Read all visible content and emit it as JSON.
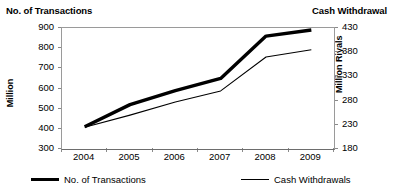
{
  "header": {
    "left_title": "No. of Transactions",
    "right_title": "Cash Withdrawal"
  },
  "axes": {
    "left_title": "Million",
    "right_title": "Million Riyals",
    "left_ticks": [
      "900",
      "800",
      "700",
      "600",
      "500",
      "400",
      "300"
    ],
    "right_ticks": [
      "430",
      "380",
      "330",
      "280",
      "230",
      "180"
    ],
    "x_ticks": [
      "2004",
      "2005",
      "2006",
      "2007",
      "2008",
      "2009"
    ]
  },
  "legend": {
    "items": [
      {
        "label": "No. of Transactions",
        "style": "thick"
      },
      {
        "label": "Cash Withdrawals",
        "style": "thin"
      }
    ]
  },
  "chart_data": {
    "type": "line",
    "title": "",
    "subtitle": "",
    "xlabel": "",
    "ylabel": "Million",
    "y2label": "Million Riyals",
    "grid": false,
    "legend_position": "bottom",
    "categories": [
      "2004",
      "2005",
      "2006",
      "2007",
      "2008",
      "2009"
    ],
    "ylim": [
      300,
      900
    ],
    "y2lim": [
      180,
      430
    ],
    "y_ticks": [
      300,
      400,
      500,
      600,
      700,
      800,
      900
    ],
    "y2_ticks": [
      180,
      230,
      280,
      330,
      380,
      430
    ],
    "series": [
      {
        "name": "No. of Transactions",
        "axis": "left",
        "unit": "Million",
        "line_width": 3,
        "color": "#000000",
        "values": [
          410,
          520,
          590,
          650,
          860,
          890
        ]
      },
      {
        "name": "Cash Withdrawals",
        "axis": "right",
        "unit": "Million Riyals",
        "line_width": 1,
        "color": "#000000",
        "values": [
          225,
          250,
          277,
          300,
          370,
          385
        ]
      }
    ]
  }
}
